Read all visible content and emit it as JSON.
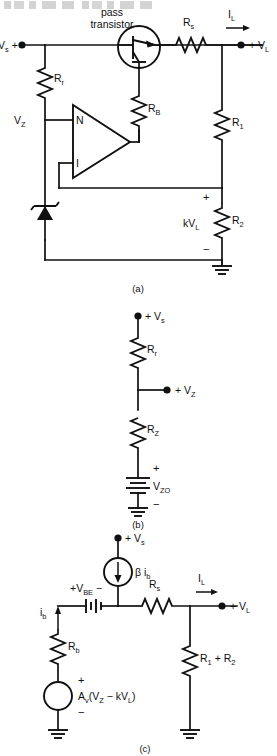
{
  "page": {
    "header_faint_text": "",
    "figures": [
      {
        "caption": "(a)",
        "name": "series-regulator-with-op-amp"
      },
      {
        "caption": "(b)",
        "name": "zener-reference-model"
      },
      {
        "caption": "(c)",
        "name": "small-signal-equivalent"
      }
    ]
  },
  "figure_a": {
    "caption": "(a)",
    "labels": {
      "vs": "V",
      "vs_sub": "s",
      "vs_sign": "+",
      "pass_transistor_line1": "pass",
      "pass_transistor_line2": "transistor",
      "rs": "R",
      "rs_sub": "s",
      "il": "I",
      "il_sub": "L",
      "vl_sign": "+",
      "vl": "V",
      "vl_sub": "L",
      "rr": "R",
      "rr_sub": "r",
      "rb": "R",
      "rb_sub": "B",
      "r1": "R",
      "r1_sub": "1",
      "r2": "R",
      "r2_sub": "2",
      "vz": "V",
      "vz_sub": "Z",
      "opamp_noninverting": "N",
      "opamp_inverting": "I",
      "kvl": "kV",
      "kvl_sub": "L",
      "plus": "+",
      "minus": "−"
    }
  },
  "figure_b": {
    "caption": "(b)",
    "labels": {
      "vs_sign": "+",
      "vs": "V",
      "vs_sub": "s",
      "rr": "R",
      "rr_sub": "r",
      "vz_sign": "+",
      "vz": "V",
      "vz_sub": "Z",
      "rz": "R",
      "rz_sub": "Z",
      "vzo": "V",
      "vzo_sub": "ZO",
      "plus": "+",
      "minus": "−"
    }
  },
  "figure_c": {
    "caption": "(c)",
    "labels": {
      "vs_sign": "+",
      "vs": "V",
      "vs_sub": "s",
      "beta": "β",
      "ib_src": "i",
      "ib_src_sub": "b",
      "vbe_plus": "+",
      "vbe": "V",
      "vbe_sub": "BE",
      "vbe_minus": "−",
      "rs": "R",
      "rs_sub": "s",
      "il": "I",
      "il_sub": "L",
      "vl_sign": "+",
      "vl": "V",
      "vl_sub": "L",
      "ib": "i",
      "ib_sub": "b",
      "rb": "R",
      "rb_sub": "b",
      "r1r2": "R",
      "r1_sub": "1",
      "plus_sign": "+",
      "r2_sub": "2",
      "src_av": "A",
      "src_av_sub": "v",
      "src_expr_open": "(V",
      "src_vz_sub": "Z",
      "src_minus": " − kV",
      "src_vl_sub": "L",
      "src_expr_close": ")",
      "plus": "+",
      "minus": "−"
    }
  },
  "colors": {
    "ink": "#101010",
    "paper": "#ffffff"
  }
}
